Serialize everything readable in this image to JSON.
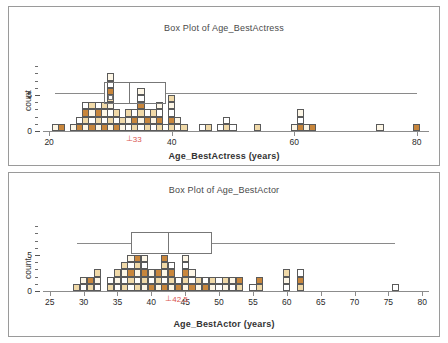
{
  "figure": {
    "width": 448,
    "height": 343,
    "background": "#ffffff",
    "border_color": "#9a9a9a"
  },
  "palette": {
    "outline": "#5a5a5a",
    "fill_light": "#fdf6e6",
    "fill_mid": "#f0d9a8",
    "fill_dark": "#c8863c",
    "fill_white": "#ffffff",
    "box_line": "#777777",
    "whisker": "#8a8a8a",
    "median_marker": "#d9534f",
    "axis": "#8c8c8c",
    "text": "#2b2b2b"
  },
  "panels": [
    {
      "id": "actress",
      "title": "Box Plot of Age_BestActress",
      "xlabel": "Age_BestActress (years)",
      "ylabel": "count",
      "median_label": "33",
      "median_tick_glyph": "⊥"
    },
    {
      "id": "actor",
      "title": "Box Plot of Age_BestActor",
      "xlabel": "Age_BestActor (years)",
      "ylabel": "count",
      "median_label": "42.5",
      "median_tick_glyph": "⊥"
    }
  ],
  "chart_data": [
    {
      "type": "bar",
      "id": "actress",
      "title": "Box Plot of Age_BestActress",
      "xlabel": "Age_BestActress (years)",
      "ylabel": "count",
      "xlim": [
        19,
        82
      ],
      "ylim": [
        0,
        9
      ],
      "xticks": [
        20,
        40,
        60,
        80
      ],
      "yticks": [
        0,
        5
      ],
      "ytick_labels": [
        "0",
        "5"
      ],
      "grid": false,
      "legend": null,
      "note": "Dotplot/histogram of stacked unit squares; each square = 1 count. Bin width = 1 year.",
      "x": [
        21,
        22,
        24,
        25,
        26,
        27,
        28,
        29,
        30,
        31,
        32,
        33,
        34,
        35,
        36,
        37,
        38,
        39,
        40,
        41,
        42,
        45,
        46,
        48,
        49,
        50,
        54,
        60,
        61,
        62,
        63,
        74,
        80
      ],
      "values": [
        1,
        1,
        1,
        2,
        4,
        4,
        4,
        4,
        8,
        3,
        2,
        3,
        3,
        6,
        3,
        3,
        4,
        1,
        5,
        2,
        1,
        1,
        1,
        1,
        2,
        1,
        1,
        1,
        3,
        1,
        1,
        1,
        1
      ],
      "boxplot": {
        "min_whisker": 21,
        "q1": 29,
        "median": 33,
        "q3": 39,
        "max_whisker": 80,
        "outliers": [
          30
        ]
      }
    },
    {
      "type": "bar",
      "id": "actor",
      "title": "Box Plot of Age_BestActor",
      "xlabel": "Age_BestActor (years)",
      "ylabel": "count",
      "xlim": [
        24,
        81
      ],
      "ylim": [
        0,
        9
      ],
      "xticks": [
        25,
        30,
        35,
        40,
        45,
        50,
        55,
        60,
        65,
        70,
        75,
        80
      ],
      "yticks": [
        0,
        5
      ],
      "ytick_labels": [
        "0",
        "5"
      ],
      "grid": false,
      "legend": null,
      "note": "Dotplot/histogram of stacked unit squares; each square = 1 count. Bin width = 1 year.",
      "x": [
        29,
        30,
        31,
        32,
        34,
        35,
        36,
        37,
        38,
        39,
        40,
        41,
        42,
        43,
        44,
        45,
        46,
        47,
        48,
        49,
        50,
        51,
        52,
        53,
        55,
        56,
        60,
        62,
        76
      ],
      "values": [
        1,
        2,
        2,
        3,
        2,
        3,
        4,
        5,
        5,
        5,
        3,
        3,
        5,
        4,
        2,
        5,
        3,
        2,
        2,
        2,
        2,
        2,
        2,
        2,
        1,
        2,
        3,
        3,
        1
      ],
      "boxplot": {
        "min_whisker": 29,
        "q1": 37,
        "median": 42.5,
        "q3": 49,
        "max_whisker": 76
      }
    }
  ]
}
